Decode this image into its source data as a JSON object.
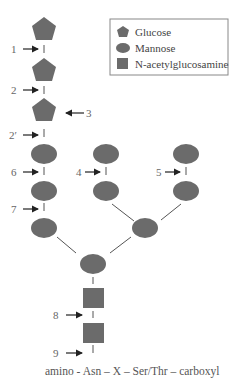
{
  "legend": {
    "items": [
      {
        "shape": "pentagon",
        "label": "Glucose"
      },
      {
        "shape": "ellipse",
        "label": "Mannose"
      },
      {
        "shape": "square",
        "label": "N-acetylglucosamine"
      }
    ]
  },
  "bond_labels": [
    "1",
    "2",
    "3",
    "2′",
    "6",
    "4",
    "5",
    "7",
    "8",
    "9"
  ],
  "footer": "amino - Asn – X – Ser/Thr – carboxyl",
  "colors": {
    "sugar_fill": "#6b6b6b",
    "line": "#555555",
    "legend_border": "#888888"
  }
}
